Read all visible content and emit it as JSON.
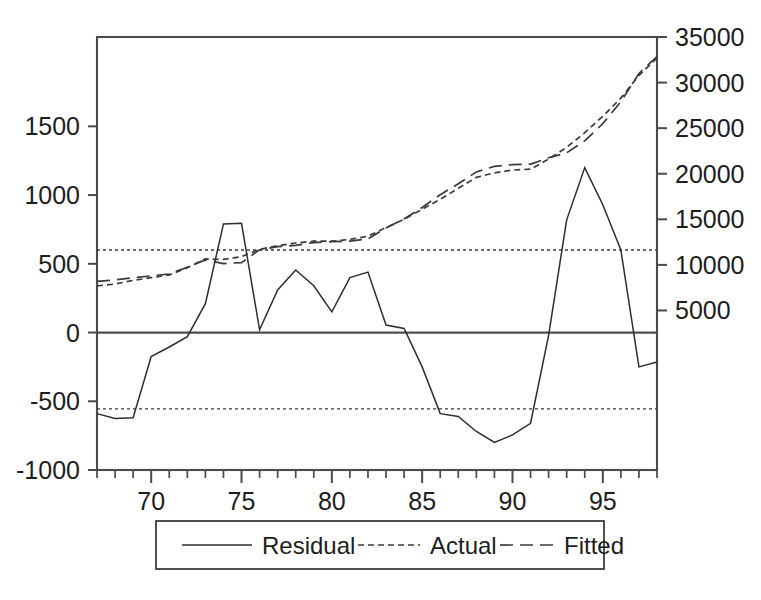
{
  "chart_data": {
    "type": "line",
    "title": "",
    "subtitle": "",
    "xlabel": "",
    "ylabel": "",
    "grid": false,
    "legend_position": "bottom",
    "x": [
      67,
      68,
      69,
      70,
      71,
      72,
      73,
      74,
      75,
      76,
      77,
      78,
      79,
      80,
      81,
      82,
      83,
      84,
      85,
      86,
      87,
      88,
      89,
      90,
      91,
      92,
      93,
      94,
      95,
      96,
      97,
      98
    ],
    "xlim": [
      67,
      98
    ],
    "xticks_major": [
      70,
      75,
      80,
      85,
      90,
      95
    ],
    "xtick_labels": [
      "70",
      "75",
      "80",
      "85",
      "90",
      "95"
    ],
    "left_axis": {
      "label": "",
      "ylim": [
        -1000,
        2150
      ],
      "ticks": [
        1500,
        1000,
        500,
        0,
        -500,
        -1000
      ],
      "tick_labels": [
        "1500",
        "1000",
        "500",
        "0",
        "-500",
        "-1000"
      ]
    },
    "right_axis": {
      "label": "",
      "ylim": [
        -12500,
        35000
      ],
      "ticks": [
        35000,
        30000,
        25000,
        20000,
        15000,
        10000,
        5000
      ],
      "tick_labels": [
        "35000",
        "30000",
        "25000",
        "20000",
        "15000",
        "10000",
        "5000"
      ]
    },
    "series": [
      {
        "name": "Residual",
        "axis": "left",
        "style": "solid",
        "color": "#2e2e2e",
        "values": [
          -590,
          -625,
          -620,
          -175,
          -105,
          -30,
          210,
          790,
          795,
          20,
          310,
          455,
          340,
          150,
          400,
          440,
          55,
          30,
          -250,
          -590,
          -610,
          -720,
          -800,
          -745,
          -660,
          -20,
          820,
          1200,
          930,
          600,
          -250,
          -215
        ]
      },
      {
        "name": "Actual",
        "axis": "right",
        "style": "dotted",
        "color": "#3a3a3a",
        "values": [
          7700,
          7900,
          8300,
          8600,
          8900,
          9700,
          10650,
          10600,
          10900,
          11700,
          12100,
          12400,
          12600,
          12600,
          12800,
          13150,
          14100,
          15000,
          16100,
          17200,
          18400,
          19600,
          20100,
          20400,
          20500,
          21600,
          22900,
          24500,
          26300,
          28300,
          30800,
          32700
        ]
      },
      {
        "name": "Fitted",
        "axis": "right",
        "style": "dashed",
        "color": "#3a3a3a",
        "values": [
          8200,
          8350,
          8600,
          8800,
          9000,
          9750,
          10550,
          10150,
          10250,
          11650,
          12000,
          12150,
          12450,
          12550,
          12600,
          12850,
          14050,
          15050,
          16300,
          17700,
          18900,
          20200,
          20800,
          21000,
          21050,
          21750,
          22300,
          23600,
          25500,
          27900,
          31000,
          32850
        ]
      }
    ],
    "reference_bands": [
      {
        "name": "upper-band",
        "axis": "left",
        "value": 600,
        "style": "dotted"
      },
      {
        "name": "lower-band",
        "axis": "left",
        "value": -555,
        "style": "dotted"
      },
      {
        "name": "zero-line",
        "axis": "left",
        "value": 0,
        "style": "solid"
      }
    ],
    "legend": {
      "items": [
        {
          "label": "Residual",
          "style": "solid"
        },
        {
          "label": "Actual",
          "style": "dotted"
        },
        {
          "label": "Fitted",
          "style": "dashed"
        }
      ]
    }
  }
}
